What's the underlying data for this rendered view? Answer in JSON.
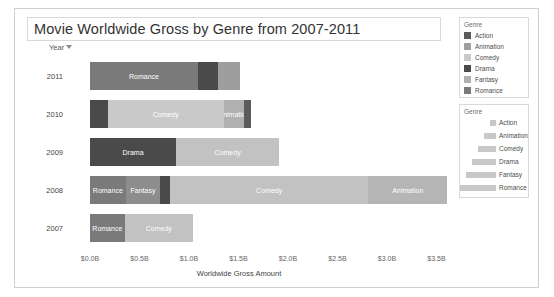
{
  "title": "Movie Worldwide Gross by Genre from 2007-2011",
  "axes": {
    "y_header": "Year",
    "y_filter_icon": "filter-icon",
    "x_title": "Worldwide Gross Amount"
  },
  "legend_color": {
    "title": "Genre",
    "items": [
      {
        "label": "Action",
        "color": "#5b5b5b"
      },
      {
        "label": "Animation",
        "color": "#9e9e9e"
      },
      {
        "label": "Comedy",
        "color": "#c9c9c9"
      },
      {
        "label": "Drama",
        "color": "#4a4a4a"
      },
      {
        "label": "Fantasy",
        "color": "#b0b0b0"
      },
      {
        "label": "Romance",
        "color": "#7a7a7a"
      }
    ]
  },
  "legend_size": {
    "title": "Genre",
    "items": [
      {
        "label": "Action",
        "width": 6
      },
      {
        "label": "Animation",
        "width": 12
      },
      {
        "label": "Comedy",
        "width": 18
      },
      {
        "label": "Drama",
        "width": 24
      },
      {
        "label": "Fantasy",
        "width": 30
      },
      {
        "label": "Romance",
        "width": 36
      }
    ]
  },
  "chart_data": {
    "type": "bar",
    "orientation": "horizontal",
    "stacked": true,
    "title": "Movie Worldwide Gross by Genre from 2007-2011",
    "xlabel": "Worldwide Gross Amount",
    "ylabel": "Year",
    "xlim": [
      0,
      3.75
    ],
    "xticks": [
      0,
      0.5,
      1.0,
      1.5,
      2.0,
      2.5,
      3.0,
      3.5
    ],
    "xticklabels": [
      "$0.0B",
      "$0.5B",
      "$1.0B",
      "$1.5B",
      "$2.0B",
      "$2.5B",
      "$3.0B",
      "$3.5B"
    ],
    "categories": [
      "2011",
      "2010",
      "2009",
      "2008",
      "2007"
    ],
    "grid": false,
    "legend_position": "right",
    "units": "billions USD",
    "rows": [
      {
        "year": "2011",
        "total": 1.52,
        "segments": [
          {
            "genre": "Romance",
            "value": 1.09,
            "label": "Romance",
            "color": "#7a7a7a",
            "show_label": true
          },
          {
            "genre": "Drama",
            "value": 0.2,
            "label": "Drama",
            "color": "#4a4a4a",
            "show_label": false
          },
          {
            "genre": "Animation",
            "value": 0.23,
            "label": "Animation",
            "color": "#9e9e9e",
            "show_label": false
          }
        ]
      },
      {
        "year": "2010",
        "total": 1.63,
        "segments": [
          {
            "genre": "Drama",
            "value": 0.18,
            "label": "Drama",
            "color": "#4a4a4a",
            "show_label": false
          },
          {
            "genre": "Comedy",
            "value": 1.17,
            "label": "Comedy",
            "color": "#c9c9c9",
            "show_label": true
          },
          {
            "genre": "Animation",
            "value": 0.21,
            "label": "Animation",
            "color": "#b0b0b0",
            "show_label": true
          },
          {
            "genre": "Action",
            "value": 0.07,
            "label": "Action",
            "color": "#5b5b5b",
            "show_label": false
          }
        ]
      },
      {
        "year": "2009",
        "total": 1.91,
        "segments": [
          {
            "genre": "Drama",
            "value": 0.87,
            "label": "Drama",
            "color": "#4a4a4a",
            "show_label": true
          },
          {
            "genre": "Comedy",
            "value": 1.04,
            "label": "Comedy",
            "color": "#c2c2c2",
            "show_label": true
          }
        ]
      },
      {
        "year": "2008",
        "total": 3.61,
        "segments": [
          {
            "genre": "Romance",
            "value": 0.36,
            "label": "Romance",
            "color": "#7a7a7a",
            "show_label": true
          },
          {
            "genre": "Fantasy",
            "value": 0.35,
            "label": "Fantasy",
            "color": "#8d8d8d",
            "show_label": true
          },
          {
            "genre": "Drama",
            "value": 0.1,
            "label": "Drama",
            "color": "#4a4a4a",
            "show_label": false
          },
          {
            "genre": "Comedy",
            "value": 2.0,
            "label": "Comedy",
            "color": "#c2c2c2",
            "show_label": true
          },
          {
            "genre": "Animation",
            "value": 0.8,
            "label": "Animation",
            "color": "#b5b5b5",
            "show_label": true
          }
        ]
      },
      {
        "year": "2007",
        "total": 1.04,
        "segments": [
          {
            "genre": "Romance",
            "value": 0.35,
            "label": "Romance",
            "color": "#7a7a7a",
            "show_label": true
          },
          {
            "genre": "Comedy",
            "value": 0.69,
            "label": "Comedy",
            "color": "#c2c2c2",
            "show_label": true
          }
        ]
      }
    ]
  }
}
